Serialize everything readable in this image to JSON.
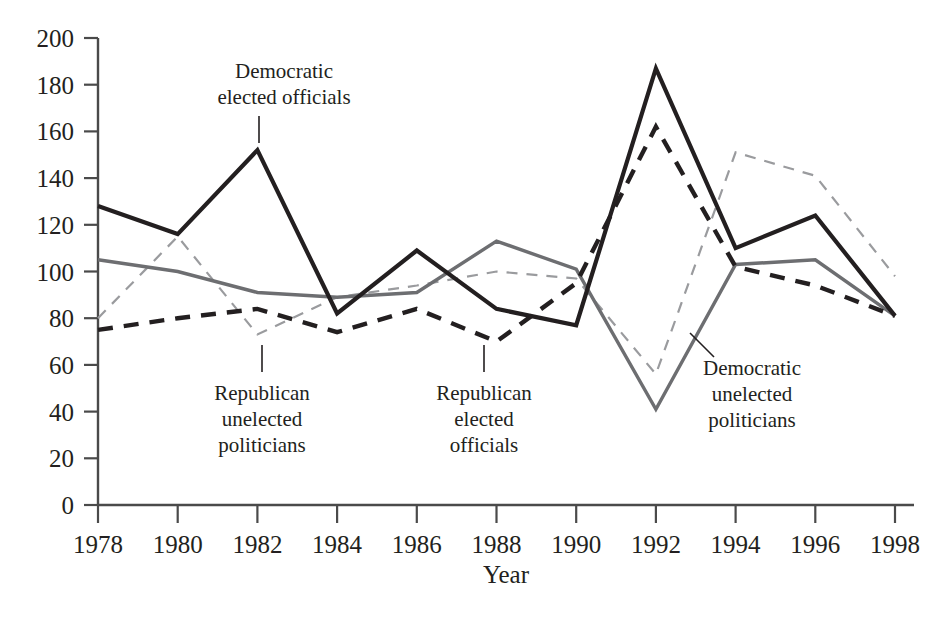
{
  "chart_data": {
    "type": "line",
    "title": "",
    "xlabel": "Year",
    "ylabel": "",
    "x": [
      1978,
      1980,
      1982,
      1984,
      1986,
      1988,
      1990,
      1992,
      1994,
      1996,
      1998
    ],
    "xtick_labels": [
      "1978",
      "1980",
      "1982",
      "1984",
      "1986",
      "1988",
      "1990",
      "1992",
      "1994",
      "1996",
      "1998"
    ],
    "ytick_labels": [
      "0",
      "20",
      "40",
      "60",
      "80",
      "100",
      "120",
      "140",
      "160",
      "180",
      "200"
    ],
    "yticks": [
      0,
      20,
      40,
      60,
      80,
      100,
      120,
      140,
      160,
      180,
      200
    ],
    "ylim": [
      0,
      200
    ],
    "xlim": [
      1978,
      1998
    ],
    "grid": false,
    "legend": "annotations-inline",
    "series": [
      {
        "name": "Democratic elected officials",
        "style": "solid",
        "color": "#231f20",
        "width": "thick",
        "values": [
          128,
          116,
          152,
          82,
          109,
          84,
          77,
          187,
          110,
          124,
          81
        ]
      },
      {
        "name": "Democratic unelected politicians",
        "style": "solid",
        "color": "#6d6e71",
        "width": "medium",
        "values": [
          105,
          100,
          91,
          89,
          91,
          113,
          101,
          41,
          103,
          105,
          81
        ]
      },
      {
        "name": "Republican elected officials",
        "style": "dashed",
        "color": "#231f20",
        "width": "thick",
        "values": [
          75,
          80,
          84,
          74,
          84,
          70,
          95,
          162,
          102,
          94,
          81
        ]
      },
      {
        "name": "Republican unelected politicians",
        "style": "dashed",
        "color": "#9a9b9e",
        "width": "thin",
        "values": [
          80,
          115,
          73,
          89,
          94,
          100,
          97,
          56,
          151,
          141,
          98
        ]
      }
    ],
    "annotations": [
      {
        "id": "democratic-elected-officials",
        "lines": [
          "Democratic",
          "elected officials"
        ],
        "text_x": 284,
        "text_y": 78,
        "leader": {
          "x1": 259,
          "y1": 116,
          "x2": 259,
          "y2": 143
        }
      },
      {
        "id": "republican-unelected-politicians",
        "lines": [
          "Republican",
          "unelected",
          "politicians"
        ],
        "text_x": 262,
        "text_y": 400,
        "leader": {
          "x1": 262,
          "y1": 345,
          "x2": 262,
          "y2": 372
        }
      },
      {
        "id": "republican-elected-officials",
        "lines": [
          "Republican",
          "elected",
          "officials"
        ],
        "text_x": 484,
        "text_y": 400,
        "leader": {
          "x1": 484,
          "y1": 345,
          "x2": 484,
          "y2": 372
        }
      },
      {
        "id": "democratic-unelected-politicians",
        "lines": [
          "Democratic",
          "unelected",
          "politicians"
        ],
        "text_x": 752,
        "text_y": 375,
        "leader": {
          "x1": 690,
          "y1": 333,
          "x2": 714,
          "y2": 357
        }
      }
    ]
  },
  "axis_title": "Year"
}
